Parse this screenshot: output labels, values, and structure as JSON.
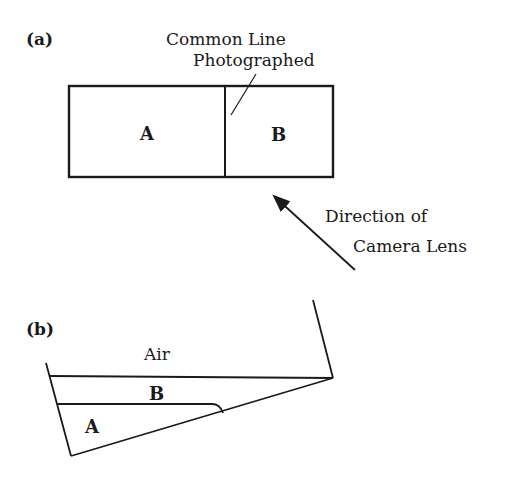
{
  "panel_a": {
    "label": "(a)",
    "callout_line1": "Common Line",
    "callout_line2": "Photographed",
    "region_a": "A",
    "region_b": "B",
    "arrow_line1": "Direction of",
    "arrow_line2": "Camera Lens"
  },
  "panel_b": {
    "label": "(b)",
    "air": "Air",
    "layer_b": "B",
    "layer_a": "A"
  },
  "colors": {
    "ink": "#1a1a1a",
    "background": "#ffffff"
  }
}
